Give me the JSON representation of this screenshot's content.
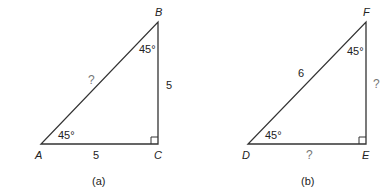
{
  "figures": [
    {
      "caption": "(a)",
      "vertices": {
        "A": "A",
        "B": "B",
        "C": "C"
      },
      "angle_A": "45°",
      "angle_B": "45°",
      "side_AC": "5",
      "side_BC": "5",
      "side_AB": "?"
    },
    {
      "caption": "(b)",
      "vertices": {
        "D": "D",
        "E": "E",
        "F": "F"
      },
      "angle_D": "45°",
      "angle_F": "45°",
      "side_DF": "6",
      "side_EF": "?",
      "side_DE": "?"
    }
  ],
  "colors": {
    "line": "#333333",
    "text": "#222222",
    "unknown": "#777777"
  }
}
